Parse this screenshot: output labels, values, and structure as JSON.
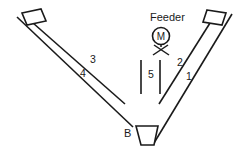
{
  "diagram": {
    "type": "v-shaped-feeder-conveyor-schematic",
    "background_color": "#ffffff",
    "stroke_color": "#1a1a1a",
    "canvas": {
      "width": 248,
      "height": 149
    },
    "labels": {
      "feeder": "Feeder",
      "motor": "M",
      "bin": "B",
      "arm_right_outer": "1",
      "arm_right_inner": "2",
      "arm_left_inner": "3",
      "arm_left_outer": "4",
      "center_chute": "5"
    },
    "label_positions": {
      "feeder": {
        "x": 150,
        "y": 21
      },
      "motor": {
        "x": 161,
        "y": 40
      },
      "bin": {
        "x": 124,
        "y": 137
      },
      "arm_right_outer": {
        "x": 186,
        "y": 80
      },
      "arm_right_inner": {
        "x": 177,
        "y": 66
      },
      "arm_left_inner": {
        "x": 90,
        "y": 63
      },
      "arm_left_outer": {
        "x": 80,
        "y": 77
      },
      "center_chute": {
        "x": 148,
        "y": 78
      }
    },
    "geometry": {
      "left_arm_inner_line": {
        "x1": 33,
        "y1": 23,
        "x2": 125,
        "y2": 104
      },
      "left_arm_outer_line": {
        "x1": 17,
        "y1": 17,
        "x2": 133,
        "y2": 127
      },
      "right_arm_inner_line": {
        "x1": 210,
        "y1": 23,
        "x2": 159,
        "y2": 104
      },
      "right_arm_outer_line": {
        "x1": 232,
        "y1": 14,
        "x2": 154,
        "y2": 143
      },
      "left_flag": [
        [
          22,
          13
        ],
        [
          41,
          9
        ],
        [
          46,
          21
        ],
        [
          27,
          25
        ]
      ],
      "right_flag": [
        [
          207,
          10
        ],
        [
          226,
          13
        ],
        [
          222,
          25
        ],
        [
          203,
          22
        ]
      ],
      "motor_circle": {
        "cx": 161,
        "cy": 36,
        "r": 8.5
      },
      "motor_stand": {
        "apex_x": 161,
        "apex_y": 45,
        "left_x": 153,
        "right_x": 169,
        "foot_y": 55
      },
      "chute_line_left": {
        "x": 141,
        "y1": 60,
        "y2": 94
      },
      "chute_line_right": {
        "x": 160,
        "y1": 60,
        "y2": 94
      },
      "bin_trapezoid": [
        [
          136,
          126
        ],
        [
          158,
          126
        ],
        [
          154,
          145
        ],
        [
          141,
          145
        ]
      ]
    }
  }
}
